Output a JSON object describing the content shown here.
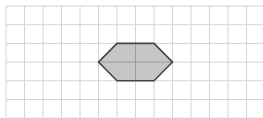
{
  "figure": {
    "grid": {
      "origin_x": 6,
      "origin_y": 6,
      "cell_w": 18.5,
      "cell_h": 18.7,
      "cols": 14,
      "rows": 6,
      "line_color": "#d4d4d4"
    },
    "shape": {
      "name": "hexagon",
      "vertices_grid": [
        [
          5,
          3
        ],
        [
          6,
          2
        ],
        [
          8,
          2
        ],
        [
          9,
          3
        ],
        [
          8,
          4
        ],
        [
          6,
          4
        ]
      ],
      "fill": "#c6c6c6",
      "stroke": "#454545",
      "inner_lines_color": "#9a9a9a"
    }
  }
}
